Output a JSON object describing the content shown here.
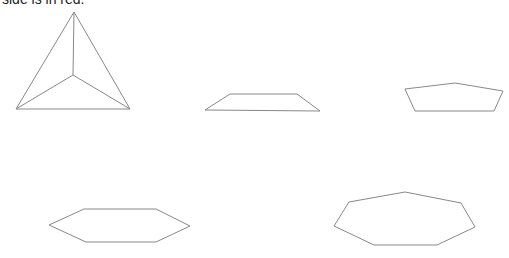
{
  "caption": "side is in red.",
  "shapes": [
    {
      "name": "tetrahedron",
      "outer": "74,12 130,109 16,109",
      "inner_center": "73,75"
    },
    {
      "name": "trapezoid",
      "points": "230,94 297,94 320,111 205,110"
    },
    {
      "name": "pentagon",
      "points": "405,89 455,83 503,91 494,111 415,111"
    },
    {
      "name": "hexagon",
      "points": "49,225 84,209 156,209 190,226 156,242 86,242"
    },
    {
      "name": "heptagon",
      "points": "349,202 405,192 461,203 475,227 437,245 374,245 334,226"
    }
  ],
  "stroke_color": "#888888"
}
